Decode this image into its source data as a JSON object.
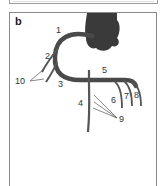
{
  "figure": {
    "panel_label": "b",
    "labels": {
      "l1": "1",
      "l2": "2",
      "l3": "3",
      "l4": "4",
      "l5": "5",
      "l6": "6",
      "l7": "7",
      "l8": "8",
      "l9": "9",
      "l10": "10"
    },
    "colors": {
      "vessel": "#4a4a4a",
      "heart": "#3a3a3a",
      "border": "#8a8a8a"
    }
  }
}
